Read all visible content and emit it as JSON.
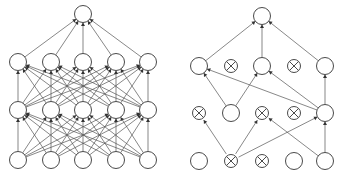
{
  "figure": {
    "background_color": "#ffffff",
    "node_fill": "#ffffff",
    "node_stroke": "#4a4a4a",
    "edge_color": "#555555",
    "arrow_color": "#333333",
    "node_radius": 8.5,
    "cross_radius": 6.5,
    "panels": [
      {
        "id": "left-panel",
        "name": "standard-neural-net",
        "caption": "",
        "origin_x": 0,
        "layers": [
          {
            "name": "output-layer",
            "y": 14,
            "nodes": [
              {
                "x": 83,
                "state": "active"
              }
            ]
          },
          {
            "name": "hidden-layer-2",
            "y": 62,
            "nodes": [
              {
                "x": 18,
                "state": "active"
              },
              {
                "x": 51,
                "state": "active"
              },
              {
                "x": 83,
                "state": "active"
              },
              {
                "x": 116,
                "state": "active"
              },
              {
                "x": 148,
                "state": "active"
              }
            ]
          },
          {
            "name": "hidden-layer-1",
            "y": 110,
            "nodes": [
              {
                "x": 18,
                "state": "active"
              },
              {
                "x": 51,
                "state": "active"
              },
              {
                "x": 83,
                "state": "active"
              },
              {
                "x": 116,
                "state": "active"
              },
              {
                "x": 148,
                "state": "active"
              }
            ]
          },
          {
            "name": "input-layer",
            "y": 160,
            "nodes": [
              {
                "x": 18,
                "state": "active"
              },
              {
                "x": 51,
                "state": "active"
              },
              {
                "x": 83,
                "state": "active"
              },
              {
                "x": 116,
                "state": "active"
              },
              {
                "x": 148,
                "state": "active"
              }
            ]
          }
        ],
        "edges": [
          {
            "from": [
              1,
              0
            ],
            "to": [
              0,
              0
            ]
          },
          {
            "from": [
              1,
              1
            ],
            "to": [
              0,
              0
            ]
          },
          {
            "from": [
              1,
              2
            ],
            "to": [
              0,
              0
            ]
          },
          {
            "from": [
              1,
              3
            ],
            "to": [
              0,
              0
            ]
          },
          {
            "from": [
              1,
              4
            ],
            "to": [
              0,
              0
            ]
          },
          {
            "from": [
              2,
              0
            ],
            "to": [
              1,
              0
            ]
          },
          {
            "from": [
              2,
              0
            ],
            "to": [
              1,
              1
            ]
          },
          {
            "from": [
              2,
              0
            ],
            "to": [
              1,
              2
            ]
          },
          {
            "from": [
              2,
              0
            ],
            "to": [
              1,
              3
            ]
          },
          {
            "from": [
              2,
              0
            ],
            "to": [
              1,
              4
            ]
          },
          {
            "from": [
              2,
              1
            ],
            "to": [
              1,
              0
            ]
          },
          {
            "from": [
              2,
              1
            ],
            "to": [
              1,
              1
            ]
          },
          {
            "from": [
              2,
              1
            ],
            "to": [
              1,
              2
            ]
          },
          {
            "from": [
              2,
              1
            ],
            "to": [
              1,
              3
            ]
          },
          {
            "from": [
              2,
              1
            ],
            "to": [
              1,
              4
            ]
          },
          {
            "from": [
              2,
              2
            ],
            "to": [
              1,
              0
            ]
          },
          {
            "from": [
              2,
              2
            ],
            "to": [
              1,
              1
            ]
          },
          {
            "from": [
              2,
              2
            ],
            "to": [
              1,
              2
            ]
          },
          {
            "from": [
              2,
              2
            ],
            "to": [
              1,
              3
            ]
          },
          {
            "from": [
              2,
              2
            ],
            "to": [
              1,
              4
            ]
          },
          {
            "from": [
              2,
              3
            ],
            "to": [
              1,
              0
            ]
          },
          {
            "from": [
              2,
              3
            ],
            "to": [
              1,
              1
            ]
          },
          {
            "from": [
              2,
              3
            ],
            "to": [
              1,
              2
            ]
          },
          {
            "from": [
              2,
              3
            ],
            "to": [
              1,
              3
            ]
          },
          {
            "from": [
              2,
              3
            ],
            "to": [
              1,
              4
            ]
          },
          {
            "from": [
              2,
              4
            ],
            "to": [
              1,
              0
            ]
          },
          {
            "from": [
              2,
              4
            ],
            "to": [
              1,
              1
            ]
          },
          {
            "from": [
              2,
              4
            ],
            "to": [
              1,
              2
            ]
          },
          {
            "from": [
              2,
              4
            ],
            "to": [
              1,
              3
            ]
          },
          {
            "from": [
              2,
              4
            ],
            "to": [
              1,
              4
            ]
          },
          {
            "from": [
              3,
              0
            ],
            "to": [
              2,
              0
            ]
          },
          {
            "from": [
              3,
              0
            ],
            "to": [
              2,
              1
            ]
          },
          {
            "from": [
              3,
              0
            ],
            "to": [
              2,
              2
            ]
          },
          {
            "from": [
              3,
              0
            ],
            "to": [
              2,
              3
            ]
          },
          {
            "from": [
              3,
              0
            ],
            "to": [
              2,
              4
            ]
          },
          {
            "from": [
              3,
              1
            ],
            "to": [
              2,
              0
            ]
          },
          {
            "from": [
              3,
              1
            ],
            "to": [
              2,
              1
            ]
          },
          {
            "from": [
              3,
              1
            ],
            "to": [
              2,
              2
            ]
          },
          {
            "from": [
              3,
              1
            ],
            "to": [
              2,
              3
            ]
          },
          {
            "from": [
              3,
              1
            ],
            "to": [
              2,
              4
            ]
          },
          {
            "from": [
              3,
              2
            ],
            "to": [
              2,
              0
            ]
          },
          {
            "from": [
              3,
              2
            ],
            "to": [
              2,
              1
            ]
          },
          {
            "from": [
              3,
              2
            ],
            "to": [
              2,
              2
            ]
          },
          {
            "from": [
              3,
              2
            ],
            "to": [
              2,
              3
            ]
          },
          {
            "from": [
              3,
              2
            ],
            "to": [
              2,
              4
            ]
          },
          {
            "from": [
              3,
              3
            ],
            "to": [
              2,
              0
            ]
          },
          {
            "from": [
              3,
              3
            ],
            "to": [
              2,
              1
            ]
          },
          {
            "from": [
              3,
              3
            ],
            "to": [
              2,
              2
            ]
          },
          {
            "from": [
              3,
              3
            ],
            "to": [
              2,
              3
            ]
          },
          {
            "from": [
              3,
              3
            ],
            "to": [
              2,
              4
            ]
          },
          {
            "from": [
              3,
              4
            ],
            "to": [
              2,
              0
            ]
          },
          {
            "from": [
              3,
              4
            ],
            "to": [
              2,
              1
            ]
          },
          {
            "from": [
              3,
              4
            ],
            "to": [
              2,
              2
            ]
          },
          {
            "from": [
              3,
              4
            ],
            "to": [
              2,
              3
            ]
          },
          {
            "from": [
              3,
              4
            ],
            "to": [
              2,
              4
            ]
          }
        ]
      },
      {
        "id": "right-panel",
        "name": "dropout-neural-net",
        "caption": "",
        "origin_x": 0,
        "layers": [
          {
            "name": "output-layer",
            "y": 16,
            "nodes": [
              {
                "x": 262,
                "state": "active"
              }
            ]
          },
          {
            "name": "hidden-layer-2",
            "y": 66,
            "nodes": [
              {
                "x": 199,
                "state": "active"
              },
              {
                "x": 231,
                "state": "dropped"
              },
              {
                "x": 262,
                "state": "active"
              },
              {
                "x": 294,
                "state": "dropped"
              },
              {
                "x": 325,
                "state": "active"
              }
            ]
          },
          {
            "name": "hidden-layer-1",
            "y": 113,
            "nodes": [
              {
                "x": 199,
                "state": "dropped"
              },
              {
                "x": 231,
                "state": "active"
              },
              {
                "x": 262,
                "state": "dropped"
              },
              {
                "x": 294,
                "state": "dropped"
              },
              {
                "x": 325,
                "state": "active"
              }
            ]
          },
          {
            "name": "input-layer",
            "y": 161,
            "nodes": [
              {
                "x": 199,
                "state": "active"
              },
              {
                "x": 231,
                "state": "dropped"
              },
              {
                "x": 262,
                "state": "dropped"
              },
              {
                "x": 294,
                "state": "active"
              },
              {
                "x": 325,
                "state": "active"
              }
            ]
          }
        ],
        "edges": [
          {
            "from": [
              1,
              0
            ],
            "to": [
              0,
              0
            ]
          },
          {
            "from": [
              1,
              2
            ],
            "to": [
              0,
              0
            ]
          },
          {
            "from": [
              1,
              4
            ],
            "to": [
              0,
              0
            ]
          },
          {
            "from": [
              2,
              1
            ],
            "to": [
              1,
              0
            ]
          },
          {
            "from": [
              2,
              1
            ],
            "to": [
              1,
              2
            ]
          },
          {
            "from": [
              2,
              4
            ],
            "to": [
              1,
              0
            ]
          },
          {
            "from": [
              2,
              4
            ],
            "to": [
              1,
              2
            ]
          },
          {
            "from": [
              2,
              4
            ],
            "to": [
              1,
              4
            ]
          },
          {
            "from": [
              3,
              1
            ],
            "to": [
              2,
              0
            ]
          },
          {
            "from": [
              3,
              1
            ],
            "to": [
              2,
              2
            ]
          },
          {
            "from": [
              3,
              1
            ],
            "to": [
              2,
              4
            ]
          },
          {
            "from": [
              3,
              4
            ],
            "to": [
              2,
              2
            ]
          },
          {
            "from": [
              3,
              4
            ],
            "to": [
              2,
              4
            ]
          }
        ]
      }
    ]
  },
  "chart_data": {
    "type": "diagram",
    "panel_labels": [
      "standard neural net",
      "after applying dropout"
    ],
    "legend": [
      {
        "symbol": "circle",
        "meaning": "active unit"
      },
      {
        "symbol": "crossed-circle",
        "meaning": "dropped unit"
      }
    ],
    "left_panel_layer_sizes": [
      1,
      5,
      5,
      5
    ],
    "right_panel_layer_sizes": [
      1,
      5,
      5,
      5
    ],
    "right_panel_dropped_counts": [
      0,
      2,
      3,
      2
    ],
    "right_panel_active_counts": [
      1,
      3,
      2,
      3
    ],
    "left_panel_edge_count": 55,
    "right_panel_edge_count": 13
  }
}
